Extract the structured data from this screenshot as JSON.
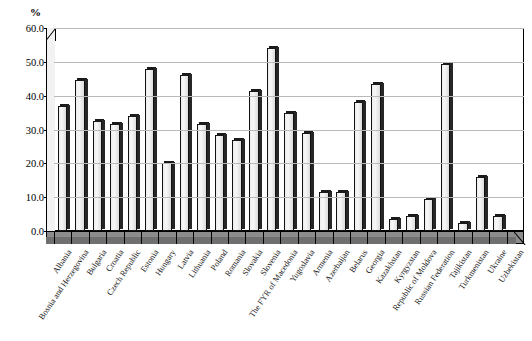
{
  "chart_data": {
    "type": "bar",
    "title": "",
    "subtitle": "",
    "xlabel": "",
    "ylabel": "%",
    "ylim": [
      0,
      60
    ],
    "ytick_step": 10,
    "ytick_labels": [
      "0.0",
      "10.0",
      "20.0",
      "30.0",
      "40.0",
      "50.0",
      "60.0"
    ],
    "grid": true,
    "legend": "none",
    "bar_style": "3d-column-light-grey",
    "categories": [
      "Albania",
      "Bosnia and Herzegovina",
      "Bulgaria",
      "Croatia",
      "Czech Republic",
      "Estonia",
      "Hungary",
      "Latvia",
      "Lithuania",
      "Poland",
      "Romania",
      "Slovakia",
      "Slovenia",
      "The FYR of Macedonia",
      "Yugoslavia",
      "Armenia",
      "Azerbaijan",
      "Belarus",
      "Georgia",
      "Kazakhstan",
      "Kyrgyzstan",
      "Republic of Moldova",
      "Russian Federation",
      "Tajikistan",
      "Turkmenistan",
      "Ukraine",
      "Uzbekistan"
    ],
    "values": [
      37.0,
      44.5,
      32.5,
      31.5,
      34.0,
      48.0,
      20.0,
      46.0,
      31.5,
      28.5,
      27.0,
      41.5,
      54.0,
      35.0,
      29.0,
      11.5,
      11.5,
      38.0,
      43.5,
      3.5,
      4.5,
      9.5,
      49.5,
      2.5,
      16.0,
      4.5,
      0.0
    ]
  },
  "axis": {
    "y_unit_label": "%"
  },
  "colors": {
    "bar_fill": "#efefef",
    "bar_edge": "#111111",
    "bar_top": "#1a1a1a",
    "gridline": "#b9b9b9",
    "floor": "#8c8c8c",
    "axis": "#000000",
    "background": "#ffffff"
  }
}
